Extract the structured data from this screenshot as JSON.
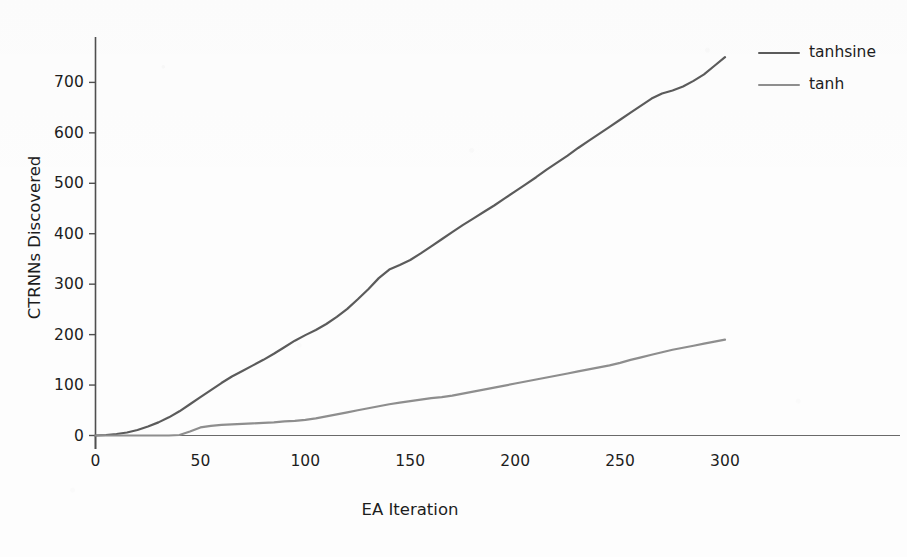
{
  "chart_data": {
    "type": "line",
    "title": "",
    "xlabel": "EA Iteration",
    "ylabel": "CTRNNs Discovered",
    "xlim": [
      0,
      300
    ],
    "ylim": [
      0,
      790
    ],
    "grid": false,
    "legend_position": "right-outside-top",
    "xticks": [
      0,
      50,
      100,
      150,
      200,
      250,
      300
    ],
    "xtick_labels": [
      "0",
      "50",
      "100",
      "150",
      "200",
      "250",
      "300"
    ],
    "yticks": [
      0,
      100,
      200,
      300,
      400,
      500,
      600,
      700
    ],
    "ytick_labels": [
      "0",
      "100",
      "200",
      "300",
      "400",
      "500",
      "600",
      "700"
    ],
    "x": [
      0,
      5,
      10,
      15,
      20,
      25,
      30,
      35,
      40,
      45,
      50,
      55,
      60,
      65,
      70,
      75,
      80,
      85,
      90,
      95,
      100,
      105,
      110,
      115,
      120,
      125,
      130,
      135,
      140,
      145,
      150,
      155,
      160,
      165,
      170,
      175,
      180,
      185,
      190,
      195,
      200,
      205,
      210,
      215,
      220,
      225,
      230,
      235,
      240,
      245,
      250,
      255,
      260,
      265,
      270,
      275,
      280,
      285,
      290,
      295,
      300
    ],
    "series": [
      {
        "name": "tanhsine",
        "color": "#5b5b5b",
        "values": [
          0,
          1,
          3,
          6,
          11,
          18,
          26,
          36,
          48,
          62,
          76,
          90,
          104,
          117,
          128,
          139,
          150,
          162,
          175,
          188,
          199,
          209,
          221,
          235,
          251,
          270,
          290,
          312,
          329,
          338,
          348,
          361,
          375,
          389,
          403,
          417,
          430,
          443,
          456,
          470,
          484,
          498,
          512,
          527,
          541,
          555,
          570,
          584,
          598,
          612,
          626,
          640,
          654,
          668,
          678,
          684,
          692,
          703,
          716,
          733,
          750
        ]
      },
      {
        "name": "tanh",
        "color": "#8e8e8e",
        "values": [
          0,
          0,
          0,
          0,
          0,
          0,
          0,
          0,
          1,
          8,
          16,
          19,
          21,
          22,
          23,
          24,
          25,
          26,
          28,
          29,
          31,
          34,
          38,
          42,
          46,
          50,
          54,
          58,
          62,
          65,
          68,
          71,
          74,
          76,
          79,
          83,
          87,
          91,
          95,
          99,
          103,
          107,
          111,
          115,
          119,
          123,
          127,
          131,
          135,
          139,
          144,
          150,
          155,
          160,
          165,
          170,
          174,
          178,
          182,
          186,
          190
        ]
      }
    ]
  },
  "legend": {
    "items": [
      {
        "label": "tanhsine",
        "color": "#5b5b5b"
      },
      {
        "label": "tanh",
        "color": "#8e8e8e"
      }
    ]
  },
  "axes": {
    "y_title": "CTRNNs Discovered",
    "x_title": "EA Iteration",
    "axis_color": "#4f4f4f"
  }
}
